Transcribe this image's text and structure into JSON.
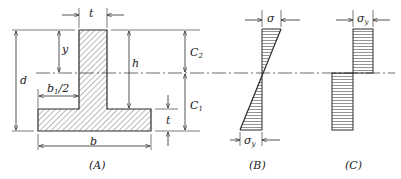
{
  "diagram": {
    "colors": {
      "stroke": "#2a2a2a",
      "hatch": "#555555",
      "background": "#ffffff"
    },
    "panel_a": {
      "caption": "(A)",
      "labels": {
        "t_web": "t",
        "y": "y",
        "d": "d",
        "h": "h",
        "b1_half": "b",
        "b1_half_sub": "1",
        "b1_half_suffix": "/2",
        "c2": "C",
        "c2_sub": "2",
        "c1": "C",
        "c1_sub": "1",
        "t_flange": "t",
        "b": "b"
      }
    },
    "panel_b": {
      "caption": "(B)",
      "labels": {
        "sigma_top": "σ",
        "sigma_y_bottom": "σ",
        "sigma_y_bottom_sub": "y"
      }
    },
    "panel_c": {
      "caption": "(C)",
      "labels": {
        "sigma_y_top": "σ",
        "sigma_y_top_sub": "y"
      }
    }
  }
}
